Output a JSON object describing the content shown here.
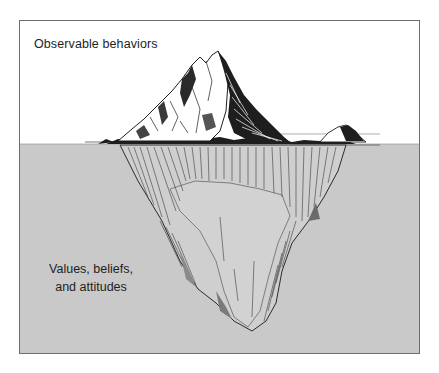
{
  "diagram": {
    "type": "iceberg-metaphor",
    "above_water": {
      "label": "Observable behaviors"
    },
    "below_water": {
      "label_lines": [
        "Values, beliefs,",
        "and attitudes"
      ]
    },
    "colors": {
      "sky": "#ffffff",
      "water": "#c9c9c9",
      "frame_border": "#6e6e6e",
      "ink": "#1e1e1e"
    }
  }
}
